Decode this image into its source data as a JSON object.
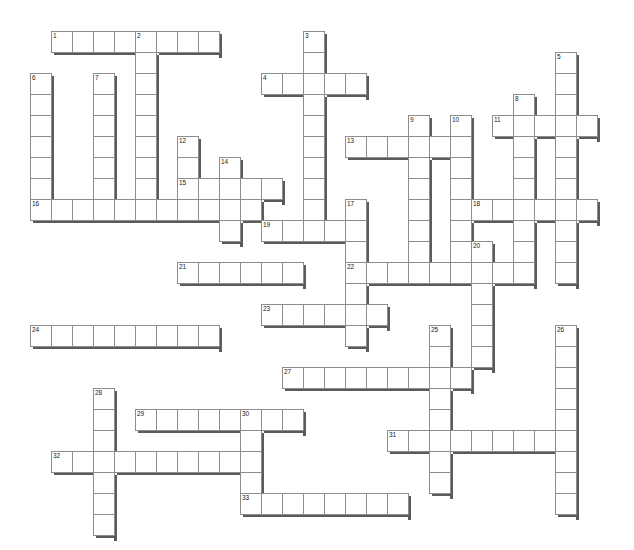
{
  "puzzle": {
    "title": "Crossword Puzzle Grid",
    "type": "crossword-grid",
    "background_color": "#ffffff",
    "cell_fill_color": "#ffffff",
    "cell_border_color": "#8d8d8d",
    "shadow_color": "#5b5b5b",
    "number_color": "#1a1a1a",
    "cell_size_px": 21,
    "origin_x_px": 30,
    "origin_y_px": 31,
    "columns": 28,
    "rows": 23,
    "entry_count": 33,
    "numbers": [
      1,
      2,
      3,
      4,
      5,
      6,
      7,
      8,
      9,
      10,
      11,
      12,
      13,
      14,
      15,
      16,
      17,
      18,
      19,
      20,
      21,
      22,
      23,
      24,
      25,
      26,
      27,
      28,
      29,
      30,
      31,
      32,
      33
    ],
    "entries": [
      {
        "number": 1,
        "direction": "across",
        "col": 1,
        "row": 0,
        "length": 8
      },
      {
        "number": 2,
        "direction": "down",
        "col": 5,
        "row": 0,
        "length": 8
      },
      {
        "number": 3,
        "direction": "down",
        "col": 13,
        "row": 0,
        "length": 9
      },
      {
        "number": 4,
        "direction": "across",
        "col": 11,
        "row": 2,
        "length": 5
      },
      {
        "number": 5,
        "direction": "down",
        "col": 25,
        "row": 1,
        "length": 11
      },
      {
        "number": 6,
        "direction": "down",
        "col": 0,
        "row": 2,
        "length": 6
      },
      {
        "number": 7,
        "direction": "down",
        "col": 3,
        "row": 2,
        "length": 6
      },
      {
        "number": 8,
        "direction": "down",
        "col": 23,
        "row": 3,
        "length": 9
      },
      {
        "number": 9,
        "direction": "down",
        "col": 18,
        "row": 4,
        "length": 8
      },
      {
        "number": 10,
        "direction": "down",
        "col": 20,
        "row": 4,
        "length": 8
      },
      {
        "number": 11,
        "direction": "across",
        "col": 22,
        "row": 4,
        "length": 5
      },
      {
        "number": 12,
        "direction": "down",
        "col": 7,
        "row": 5,
        "length": 4
      },
      {
        "number": 13,
        "direction": "across",
        "col": 15,
        "row": 5,
        "length": 5
      },
      {
        "number": 14,
        "direction": "down",
        "col": 9,
        "row": 6,
        "length": 4
      },
      {
        "number": 15,
        "direction": "across",
        "col": 7,
        "row": 7,
        "length": 5
      },
      {
        "number": 16,
        "direction": "across",
        "col": 0,
        "row": 8,
        "length": 11
      },
      {
        "number": 17,
        "direction": "down",
        "col": 15,
        "row": 8,
        "length": 7
      },
      {
        "number": 18,
        "direction": "across",
        "col": 21,
        "row": 8,
        "length": 6
      },
      {
        "number": 19,
        "direction": "across",
        "col": 11,
        "row": 9,
        "length": 5
      },
      {
        "number": 20,
        "direction": "down",
        "col": 21,
        "row": 10,
        "length": 6
      },
      {
        "number": 21,
        "direction": "across",
        "col": 7,
        "row": 11,
        "length": 6
      },
      {
        "number": 22,
        "direction": "across",
        "col": 15,
        "row": 11,
        "length": 9
      },
      {
        "number": 23,
        "direction": "across",
        "col": 11,
        "row": 13,
        "length": 6
      },
      {
        "number": 24,
        "direction": "across",
        "col": 0,
        "row": 14,
        "length": 9
      },
      {
        "number": 25,
        "direction": "down",
        "col": 19,
        "row": 14,
        "length": 8
      },
      {
        "number": 26,
        "direction": "down",
        "col": 25,
        "row": 14,
        "length": 9
      },
      {
        "number": 27,
        "direction": "across",
        "col": 12,
        "row": 16,
        "length": 9
      },
      {
        "number": 28,
        "direction": "down",
        "col": 3,
        "row": 17,
        "length": 7
      },
      {
        "number": 29,
        "direction": "across",
        "col": 5,
        "row": 18,
        "length": 8
      },
      {
        "number": 30,
        "direction": "down",
        "col": 10,
        "row": 18,
        "length": 5
      },
      {
        "number": 31,
        "direction": "across",
        "col": 17,
        "row": 19,
        "length": 8
      },
      {
        "number": 32,
        "direction": "across",
        "col": 1,
        "row": 20,
        "length": 10
      },
      {
        "number": 33,
        "direction": "across",
        "col": 10,
        "row": 22,
        "length": 8
      }
    ]
  }
}
